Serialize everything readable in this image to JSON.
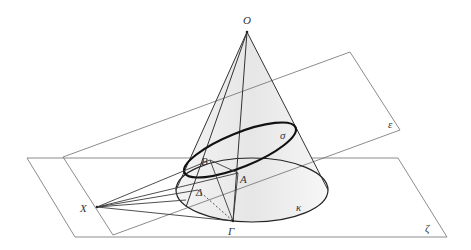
{
  "diagram": {
    "colors": {
      "background": "#ffffff",
      "planes": "#6e6e6e",
      "lines": "#333333",
      "section": "#111111",
      "cone_shade": "#ececec"
    },
    "labels": {
      "O": "O",
      "B": "B",
      "A": "A",
      "Delta": "Δ",
      "Gamma": "Γ",
      "X": "X",
      "sigma": "σ",
      "kappa": "κ",
      "epsilon": "ε",
      "zeta": "ζ"
    },
    "points": {
      "O": [
        247,
        32
      ],
      "B": [
        210,
        160
      ],
      "A": [
        238,
        173
      ],
      "Delta": [
        198,
        190
      ],
      "Gamma": [
        233,
        221
      ],
      "X": [
        97,
        207
      ]
    },
    "planes": {
      "epsilon": [
        [
          63,
          157
        ],
        [
          350,
          52
        ],
        [
          400,
          130
        ],
        [
          113,
          235
        ]
      ],
      "zeta": [
        [
          27,
          158
        ],
        [
          398,
          158
        ],
        [
          447,
          237
        ],
        [
          75,
          237
        ]
      ]
    },
    "ellipses": {
      "kappa": {
        "cx": 252,
        "cy": 190,
        "rx": 76,
        "ry": 32,
        "rotate": 0
      },
      "sigma": {
        "cx": 240,
        "cy": 150,
        "rx": 60,
        "ry": 17,
        "rotate": -22
      }
    }
  }
}
